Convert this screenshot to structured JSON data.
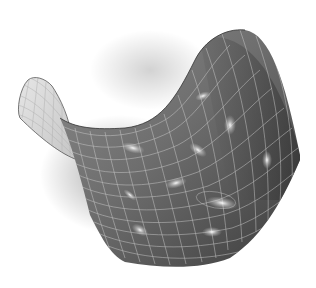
{
  "image": {
    "subject": "saddle-shaped surface",
    "description": "Grayscale 3D hyperbolic paraboloid (saddle) surface covered with a light grid, with glowing galaxies scattered across it",
    "background_color": "#ffffff",
    "surface_dark_color": "#3a3a3a",
    "surface_mid_color": "#7a7a7a",
    "surface_light_color": "#d8d8d8",
    "grid_color": "#c8c8c8",
    "galaxy_count": 10
  }
}
